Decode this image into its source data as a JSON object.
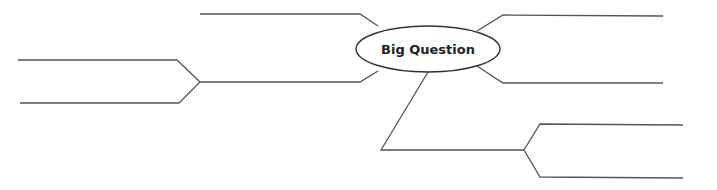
{
  "diagram": {
    "type": "concept-map",
    "center_node": {
      "label": "Big Question",
      "shape": "ellipse"
    },
    "branches": [
      {
        "id": "top-left",
        "label": ""
      },
      {
        "id": "left-upper",
        "label": ""
      },
      {
        "id": "left-lower",
        "label": ""
      },
      {
        "id": "top-right",
        "label": ""
      },
      {
        "id": "right-middle",
        "label": ""
      },
      {
        "id": "bottom-right-upper",
        "label": ""
      },
      {
        "id": "bottom-right-lower",
        "label": ""
      }
    ],
    "colors": {
      "line": "#555555",
      "ellipse_stroke": "#333333",
      "text": "#222222",
      "background": "#ffffff"
    }
  }
}
